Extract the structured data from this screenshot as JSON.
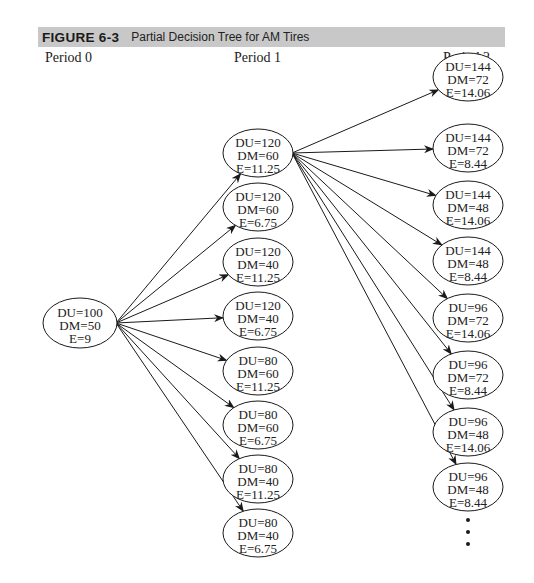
{
  "figure": {
    "label": "FIGURE 6-3",
    "title": "Partial Decision Tree for AM Tires"
  },
  "periods": [
    "Period 0",
    "Period 1",
    "Period 2"
  ],
  "tree": {
    "root": {
      "lines": [
        "DU=100",
        "DM=50",
        "E=9"
      ]
    },
    "period1": [
      {
        "lines": [
          "DU=120",
          "DM=60",
          "E=11.25"
        ]
      },
      {
        "lines": [
          "DU=120",
          "DM=60",
          "E=6.75"
        ]
      },
      {
        "lines": [
          "DU=120",
          "DM=40",
          "E=11.25"
        ]
      },
      {
        "lines": [
          "DU=120",
          "DM=40",
          "E=6.75"
        ]
      },
      {
        "lines": [
          "DU=80",
          "DM=60",
          "E=11.25"
        ]
      },
      {
        "lines": [
          "DU=80",
          "DM=60",
          "E=6.75"
        ]
      },
      {
        "lines": [
          "DU=80",
          "DM=40",
          "E=11.25"
        ]
      },
      {
        "lines": [
          "DU=80",
          "DM=40",
          "E=6.75"
        ]
      }
    ],
    "period2": [
      {
        "lines": [
          "DU=144",
          "DM=72",
          "E=14.06"
        ]
      },
      {
        "lines": [
          "DU=144",
          "DM=72",
          "E=8.44"
        ]
      },
      {
        "lines": [
          "DU=144",
          "DM=48",
          "E=14.06"
        ]
      },
      {
        "lines": [
          "DU=144",
          "DM=48",
          "E=8.44"
        ]
      },
      {
        "lines": [
          "DU=96",
          "DM=72",
          "E=14.06"
        ]
      },
      {
        "lines": [
          "DU=96",
          "DM=72",
          "E=8.44"
        ]
      },
      {
        "lines": [
          "DU=96",
          "DM=48",
          "E=14.06"
        ]
      },
      {
        "lines": [
          "DU=96",
          "DM=48",
          "E=8.44"
        ]
      }
    ],
    "continuation": "ellipsis-dots"
  },
  "colors": {
    "header_bg": "#c8c8c8",
    "line": "#1a1a1a"
  }
}
